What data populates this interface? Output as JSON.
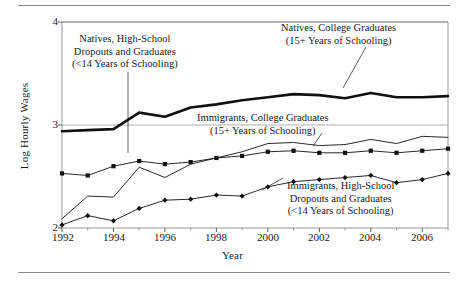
{
  "figure": {
    "has_top_rule": true,
    "has_bottom_rule": true,
    "background": "#ffffff",
    "ink": "#111111"
  },
  "chart_data": {
    "type": "line",
    "title": "",
    "subtitle": "",
    "xlabel": "Year",
    "ylabel": "Log Hourly Wages",
    "xlim": [
      1992,
      2007
    ],
    "ylim": [
      2,
      4
    ],
    "grid": true,
    "grid_lines_y": [
      3,
      4
    ],
    "legend_position": "inline-annotations",
    "x": [
      1992,
      1993,
      1994,
      1995,
      1996,
      1997,
      1998,
      1999,
      2000,
      2001,
      2002,
      2003,
      2004,
      2005,
      2006,
      2007
    ],
    "xticks_major": [
      1992,
      1994,
      1996,
      1998,
      2000,
      2002,
      2004,
      2006
    ],
    "xticks_minor": [
      1993,
      1995,
      1997,
      1999,
      2001,
      2003,
      2005,
      2007
    ],
    "yticks": [
      2,
      3,
      4
    ],
    "series": [
      {
        "name": "Natives, College Graduates (15+ Years of Schooling)",
        "short_name": "natives-college",
        "color": "#111111",
        "line_width": 2.6,
        "marker": "none",
        "values": [
          2.94,
          2.95,
          2.96,
          3.12,
          3.08,
          3.17,
          3.2,
          3.24,
          3.27,
          3.3,
          3.29,
          3.26,
          3.31,
          3.27,
          3.27,
          3.28
        ]
      },
      {
        "name": "Immigrants, College Graduates (15+ Years of Schooling)",
        "short_name": "immigrants-college",
        "color": "#111111",
        "line_width": 0.9,
        "marker": "none",
        "values": [
          2.09,
          2.31,
          2.3,
          2.59,
          2.49,
          2.62,
          2.68,
          2.74,
          2.82,
          2.83,
          2.8,
          2.81,
          2.86,
          2.82,
          2.89,
          2.88
        ]
      },
      {
        "name": "Natives, High-School Dropouts and Graduates (<14 Years of Schooling)",
        "short_name": "natives-highschool",
        "color": "#111111",
        "line_width": 0.9,
        "marker": "square",
        "values": [
          2.53,
          2.51,
          2.6,
          2.65,
          2.62,
          2.64,
          2.68,
          2.7,
          2.74,
          2.75,
          2.73,
          2.73,
          2.75,
          2.73,
          2.75,
          2.77
        ]
      },
      {
        "name": "Immigrants, High-School Dropouts and Graduates (<14 Years of Schooling)",
        "short_name": "immigrants-highschool",
        "color": "#111111",
        "line_width": 0.9,
        "marker": "diamond",
        "values": [
          2.03,
          2.12,
          2.07,
          2.19,
          2.27,
          2.28,
          2.32,
          2.31,
          2.4,
          2.45,
          2.47,
          2.49,
          2.51,
          2.44,
          2.47,
          2.53
        ]
      }
    ],
    "annotations": [
      {
        "id": "natives-highschool",
        "lines": [
          "Natives, High-School",
          "Dropouts and Graduates",
          "(<14 Years of Schooling)"
        ]
      },
      {
        "id": "natives-college",
        "lines": [
          "Natives, College Graduates",
          "(15+ Years of Schooling)"
        ]
      },
      {
        "id": "immigrants-college",
        "lines": [
          "Immigrants, College Graduates",
          "(15+ Years of Schooling)"
        ]
      },
      {
        "id": "immigrants-highschool",
        "lines": [
          "Immigrants, High-School",
          "Dropouts and Graduates",
          "(<14 Years of Schooling)"
        ]
      }
    ]
  },
  "axis": {
    "ylabel": "Log Hourly Wages",
    "xlabel": "Year",
    "yticks": [
      "4",
      "3",
      "2"
    ],
    "xticks": [
      "1992",
      "1994",
      "1996",
      "1998",
      "2000",
      "2002",
      "2004",
      "2006"
    ]
  },
  "annotation_text": {
    "natives_hs_l1": "Natives, High-School",
    "natives_hs_l2": "Dropouts and Graduates",
    "natives_hs_l3": "(<14 Years of Schooling)",
    "natives_col_l1": "Natives, College Graduates",
    "natives_col_l2": "(15+ Years of Schooling)",
    "imm_col_l1": "Immigrants, College Graduates",
    "imm_col_l2": "(15+ Years of Schooling)",
    "imm_hs_l1": "Immigrants, High-School",
    "imm_hs_l2": "Dropouts and Graduates",
    "imm_hs_l3": "(<14 Years of Schooling)"
  }
}
